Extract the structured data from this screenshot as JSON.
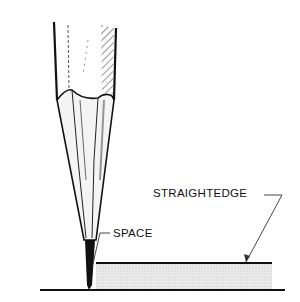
{
  "figure": {
    "labels": {
      "straightedge": "STRAIGHTEDGE",
      "space": "SPACE"
    },
    "colors": {
      "ink": "#111111",
      "shade": "#d8d8d8",
      "background": "#ffffff"
    }
  }
}
